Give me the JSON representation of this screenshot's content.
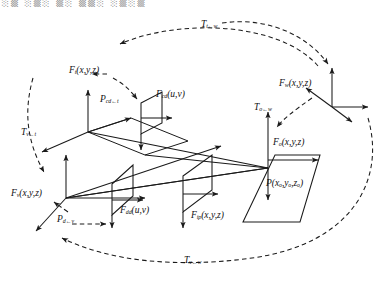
{
  "figure": {
    "type": "coordinate-frame-transform-diagram",
    "background": "#ffffff",
    "stroke": "#1a1a1a"
  },
  "top_artifact": {
    "text": "░▒ ░▒░ ▒░ ▒▒░ ░▒░▒",
    "color": "#8d8d8d"
  },
  "frames": [
    {
      "id": "frame-t",
      "name": "tool-frame",
      "base": "F",
      "subscript": "t",
      "args": "(x,y,z)",
      "label": "F",
      "x": 69,
      "y": 66
    },
    {
      "id": "frame-cd",
      "name": "camera-desired-image-frame",
      "base": "F",
      "subscript": "cd",
      "args": "(u,v)",
      "label": "F",
      "x": 156,
      "y": 90
    },
    {
      "id": "frame-w",
      "name": "world-frame",
      "base": "F",
      "subscript": "w",
      "args": "(x,y,z)",
      "label": "F",
      "x": 279,
      "y": 79
    },
    {
      "id": "frame-o",
      "name": "object-frame",
      "base": "F",
      "subscript": "o",
      "args": "(x,y,z)",
      "label": "F",
      "x": 273,
      "y": 138
    },
    {
      "id": "frame-v",
      "name": "vehicle-frame",
      "base": "F",
      "subscript": "v",
      "args": "(x,y,z)",
      "label": "F",
      "x": 11,
      "y": 189
    },
    {
      "id": "frame-dd",
      "name": "desired-image-plane-frame",
      "base": "F",
      "subscript": "dd",
      "args": "(u,v)",
      "label": "F",
      "x": 120,
      "y": 206
    },
    {
      "id": "frame-ip",
      "name": "image-plane-frame",
      "base": "F",
      "subscript": "ip",
      "args": "(x,y,z)",
      "label": "F",
      "x": 191,
      "y": 211
    }
  ],
  "points": [
    {
      "id": "point-P-object",
      "name": "object-point",
      "base": "P",
      "subscript": "",
      "args": "(xₒ,yₒ,zₒ)",
      "label": "P",
      "x": 266,
      "y": 179
    }
  ],
  "projections": [
    {
      "id": "proj-cd-t",
      "name": "projection-cd-from-t",
      "base": "P",
      "subscript": "cd←t",
      "args": "",
      "label": "P",
      "x": 100,
      "y": 95
    },
    {
      "id": "proj-d-v",
      "name": "projection-d-from-v",
      "base": "P",
      "subscript": "d←v",
      "args": "",
      "label": "P",
      "x": 57,
      "y": 215
    }
  ],
  "transforms": [
    {
      "id": "tf-t-w",
      "name": "transform-t-from-w",
      "base": "T",
      "subscript": "t←w",
      "label": "T",
      "x": 201,
      "y": 20,
      "desc": "world to tool frame transform"
    },
    {
      "id": "tf-v-t",
      "name": "transform-v-from-t",
      "base": "T",
      "subscript": "v←t",
      "label": "T",
      "x": 21,
      "y": 128,
      "desc": "tool to vehicle frame transform"
    },
    {
      "id": "tf-o-w",
      "name": "transform-o-from-w",
      "base": "T",
      "subscript": "o←w",
      "label": "T",
      "x": 254,
      "y": 103,
      "desc": "world to object frame transform"
    },
    {
      "id": "tf-v-w",
      "name": "transform-v-from-w",
      "base": "T",
      "subscript": "v←w",
      "label": "T",
      "x": 184,
      "y": 256,
      "desc": "world to vehicle frame transform"
    }
  ]
}
